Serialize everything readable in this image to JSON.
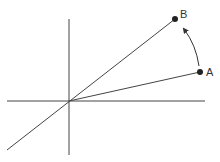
{
  "diagram": {
    "axes": {
      "horizontal": {
        "x1": 7,
        "y1": 101,
        "x2": 205,
        "y2": 101
      },
      "vertical": {
        "x1": 69,
        "y1": 19,
        "x2": 69,
        "y2": 155
      }
    },
    "origin": {
      "x": 69,
      "y": 101
    },
    "diagonal_line": {
      "x1": 7,
      "y1": 150,
      "x2": 175,
      "y2": 19
    },
    "points": [
      {
        "label": "A",
        "x": 200,
        "y": 72,
        "label_x": 206,
        "label_y": 76
      },
      {
        "label": "B",
        "x": 175,
        "y": 19,
        "label_x": 180,
        "label_y": 18
      }
    ],
    "rotation_arrow": {
      "from": "A",
      "to": "B",
      "direction": "counterclockwise"
    },
    "colors": {
      "line": "#333333",
      "point": "#222222",
      "background": "#ffffff"
    }
  }
}
